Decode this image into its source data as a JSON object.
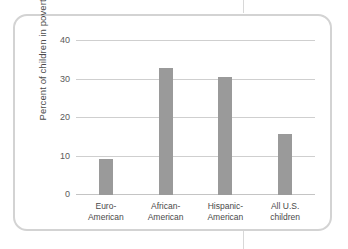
{
  "figure": {
    "frame_color": "#d3d3d3",
    "background": "#ffffff"
  },
  "chart_data": {
    "type": "bar",
    "title": "",
    "xlabel": "",
    "ylabel": "Percent of children in poverty",
    "categories": [
      "Euro-American",
      "African-American",
      "Hispanic-American",
      "All U.S. children"
    ],
    "category_lines": [
      [
        "Euro-",
        "American"
      ],
      [
        "African-",
        "American"
      ],
      [
        "Hispanic-",
        "American"
      ],
      [
        "All U.S.",
        "children"
      ]
    ],
    "values": [
      9.3,
      33.0,
      30.6,
      15.8
    ],
    "ylim": [
      0,
      40
    ],
    "yticks": [
      0,
      10,
      20,
      30,
      40
    ],
    "ytick_labels": [
      "0",
      "10",
      "20",
      "30",
      "40"
    ],
    "grid": true,
    "legend": "none",
    "bar_color": "#9a9a9a",
    "gridline_color": "#cfcfcf"
  }
}
